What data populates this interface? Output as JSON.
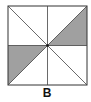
{
  "figure": {
    "label": "B",
    "square": {
      "x": 8,
      "y": 6,
      "size": 79
    },
    "divisions": [
      "vertical-midline",
      "horizontal-midline",
      "diagonal-tl-br",
      "diagonal-bl-tr"
    ],
    "shaded_regions": [
      {
        "name": "upper-right-lower-triangle",
        "points": "center,top-right,right-mid"
      },
      {
        "name": "lower-left-upper-triangle",
        "points": "center,left-mid,bottom-left"
      }
    ],
    "colors": {
      "stroke": "#333333",
      "shade": "#a0a0a0",
      "background": "#ffffff"
    }
  }
}
